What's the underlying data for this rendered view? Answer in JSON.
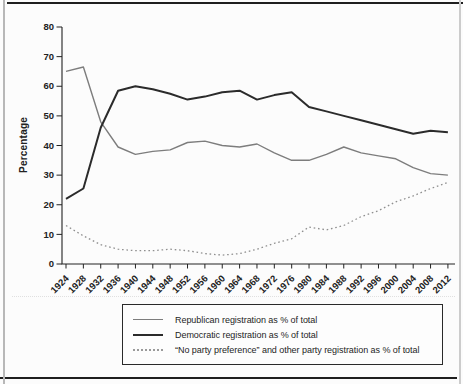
{
  "chart_data": {
    "type": "line",
    "title": "",
    "xlabel": "",
    "ylabel": "Percentage",
    "x": [
      1924,
      1928,
      1932,
      1936,
      1940,
      1944,
      1948,
      1952,
      1956,
      1960,
      1964,
      1968,
      1972,
      1976,
      1980,
      1984,
      1988,
      1992,
      1996,
      2000,
      2004,
      2008,
      2012
    ],
    "xtick_labels": [
      "1924",
      "1928",
      "1932",
      "1936",
      "1940",
      "1944",
      "1948",
      "1952",
      "1956",
      "1960",
      "1964",
      "1968",
      "1972",
      "1976",
      "1980",
      "1984",
      "1988",
      "1992",
      "1996",
      "2000",
      "2004",
      "2008",
      "2012"
    ],
    "yticks": [
      0,
      10,
      20,
      30,
      40,
      50,
      60,
      70,
      80
    ],
    "ylim": [
      0,
      80
    ],
    "grid": false,
    "legend_position": "below-chart-boxed",
    "series": [
      {
        "name": "republican",
        "label": "Republican registration as % of total",
        "color": "#7d7d7d",
        "style": "solid",
        "width": 1.4,
        "values": [
          65,
          66.5,
          48,
          39.5,
          37,
          38,
          38.5,
          41,
          41.5,
          40,
          39.5,
          40.5,
          37.5,
          35,
          35,
          37,
          39.5,
          37.5,
          36.5,
          35.5,
          32.5,
          30.5,
          30
        ]
      },
      {
        "name": "democratic",
        "label": "Democratic registration as % of total",
        "color": "#2b2b2b",
        "style": "solid",
        "width": 2,
        "values": [
          22,
          25.5,
          46,
          58.5,
          60,
          59,
          57.5,
          55.5,
          56.5,
          58,
          58.5,
          55.5,
          57,
          58,
          53,
          51.5,
          50,
          48.5,
          47,
          45.5,
          44,
          45,
          44.5
        ]
      },
      {
        "name": "no_party_other",
        "label": "“No party preference” and other party registration as % of total",
        "color": "#8f8f8f",
        "style": "dotted",
        "width": 1.3,
        "values": [
          13,
          9.5,
          6.5,
          5,
          4.5,
          4.5,
          5,
          4.5,
          3.5,
          3,
          3.5,
          5,
          7,
          8.5,
          12.5,
          11.5,
          13,
          16,
          18,
          21,
          23,
          25.5,
          27.5
        ]
      }
    ]
  }
}
